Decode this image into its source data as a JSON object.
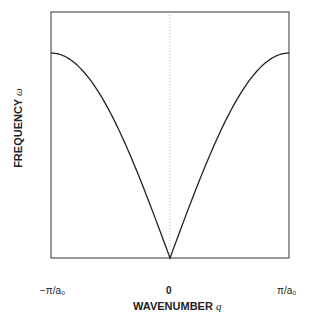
{
  "chart_data": {
    "type": "line",
    "title": "",
    "xlabel": "WAVENUMBER q",
    "ylabel": "FREQUENCY ω",
    "xlabel_text": "WAVENUMBER",
    "xlabel_symbol": "q",
    "ylabel_text": "FREQUENCY",
    "ylabel_symbol": "ω",
    "x_tick_labels": [
      "−π/a₀",
      "0",
      "π/a₀"
    ],
    "xlim": [
      -3.1416,
      3.1416
    ],
    "ylim": [
      0,
      1.2
    ],
    "grid": false,
    "legend": null,
    "annotations": [
      "dotted vertical line at q = 0"
    ],
    "series": [
      {
        "name": "dispersion ω(q) ∝ |sin(q a₀ / 2)|",
        "x": [
          -3.1416,
          -2.7489,
          -2.3562,
          -1.9635,
          -1.5708,
          -1.1781,
          -0.7854,
          -0.3927,
          0,
          0.3927,
          0.7854,
          1.1781,
          1.5708,
          1.9635,
          2.3562,
          2.7489,
          3.1416
        ],
        "y": [
          1.0,
          0.981,
          0.924,
          0.831,
          0.707,
          0.556,
          0.383,
          0.195,
          0.0,
          0.195,
          0.383,
          0.556,
          0.707,
          0.831,
          0.924,
          0.981,
          1.0
        ]
      }
    ]
  }
}
